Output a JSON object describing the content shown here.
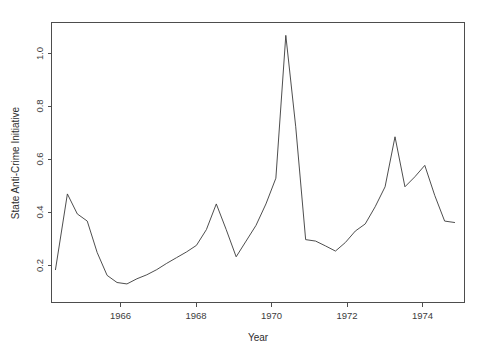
{
  "chart_data": {
    "type": "line",
    "title": "",
    "xlabel": "Year",
    "ylabel": "State Anti-Crime Initiative",
    "xlim": [
      1964.55,
      1974.95
    ],
    "ylim": [
      0.085,
      1.065
    ],
    "grid": false,
    "legend": null,
    "xticks": [
      1966,
      1968,
      1970,
      1972,
      1974
    ],
    "xtick_labels": [
      "1966",
      "1968",
      "1970",
      "1972",
      "1974"
    ],
    "yticks": [
      0.2,
      0.4,
      0.6,
      0.8,
      1.0
    ],
    "ytick_labels": [
      "0.2",
      "0.4",
      "0.6",
      "0.8",
      "1.0"
    ],
    "series": [
      {
        "name": "State Anti-Crime Initiative",
        "color": "#3a3a3a",
        "x": [
          1964.65,
          1964.95,
          1965.2,
          1965.45,
          1965.7,
          1965.95,
          1966.2,
          1966.45,
          1966.7,
          1966.95,
          1967.2,
          1967.45,
          1967.7,
          1967.95,
          1968.2,
          1968.45,
          1968.7,
          1968.95,
          1969.2,
          1969.45,
          1969.7,
          1969.95,
          1970.2,
          1970.45,
          1970.7,
          1970.95,
          1971.2,
          1971.45,
          1971.7,
          1971.95,
          1972.2,
          1972.45,
          1972.7,
          1972.95,
          1973.2,
          1973.45,
          1973.7,
          1973.95,
          1974.2,
          1974.45,
          1974.7
        ],
        "y": [
          0.2,
          0.465,
          0.395,
          0.37,
          0.26,
          0.18,
          0.155,
          0.15,
          0.168,
          0.182,
          0.2,
          0.222,
          0.242,
          0.262,
          0.285,
          0.34,
          0.43,
          0.34,
          0.245,
          0.3,
          0.355,
          0.43,
          0.52,
          1.02,
          0.7,
          0.305,
          0.3,
          0.283,
          0.265,
          0.295,
          0.335,
          0.36,
          0.42,
          0.49,
          0.665,
          0.49,
          0.525,
          0.565,
          0.46,
          0.37,
          0.365
        ]
      }
    ],
    "values_detail": {
      "start_value": 0.2,
      "max_value": 1.02,
      "max_x": 1968.85,
      "min_value": 0.1,
      "min_x": 1974.85,
      "end_value": 0.1
    }
  },
  "axes": {
    "xlabel": "Year",
    "ylabel": "State Anti-Crime Initiative",
    "xtick_labels": [
      "1966",
      "1968",
      "1970",
      "1972",
      "1974"
    ],
    "ytick_labels": [
      "0.2",
      "0.4",
      "0.6",
      "0.8",
      "1.0"
    ]
  },
  "colors": {
    "line": "#3a3a3a",
    "axis": "#4d4d4d",
    "text": "#2e2e2e",
    "background": "#ffffff"
  }
}
